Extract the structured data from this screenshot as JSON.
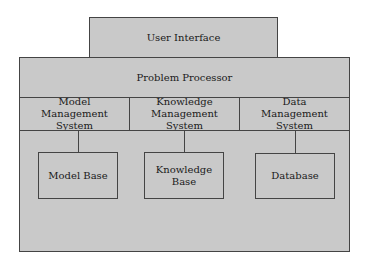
{
  "diagram": {
    "top": {
      "label": "User Interface"
    },
    "processor": {
      "label": "Problem Processor"
    },
    "systems": [
      {
        "label": "Model\nManagement\nSystem"
      },
      {
        "label": "Knowledge\nManagement\nSystem"
      },
      {
        "label": "Data\nManagement\nSystem"
      }
    ],
    "bases": [
      {
        "label": "Model Base"
      },
      {
        "label": "Knowledge\nBase"
      },
      {
        "label": "Database"
      }
    ],
    "colors": {
      "fill": "#c9c9c9",
      "stroke": "#444444"
    }
  }
}
